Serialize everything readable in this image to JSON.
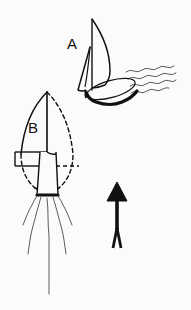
{
  "diagram": {
    "background_color": "#fbfbfb",
    "ink_color": "#111111",
    "width": 191,
    "height": 310,
    "boats": [
      {
        "id": "boat-a",
        "label": "A",
        "label_x": 72,
        "label_y": 49,
        "view": "three-quarter-astern",
        "heading": "upper-right",
        "description": "Sailboat heeled, hull shown as inclined ellipse with heavy lower outline, mainsail and jib set, wake trailing to upper right",
        "wake_lines": 4,
        "wake_direction": "upper-right"
      },
      {
        "id": "boat-b",
        "label": "B",
        "label_x": 33,
        "label_y": 133,
        "view": "directly-astern",
        "heading": "up",
        "description": "Sailboat seen from directly behind, sail half solid half dashed, transom with heavy black edge, wake trailing straight down",
        "wake_lines": 5,
        "wake_direction": "down"
      }
    ],
    "arrow": {
      "id": "wind-arrow",
      "direction": "up",
      "style": "solid-filled-triangle-head-with-forked-tail",
      "x": 117,
      "y_top": 182,
      "y_bottom": 248,
      "color": "#111111"
    }
  }
}
